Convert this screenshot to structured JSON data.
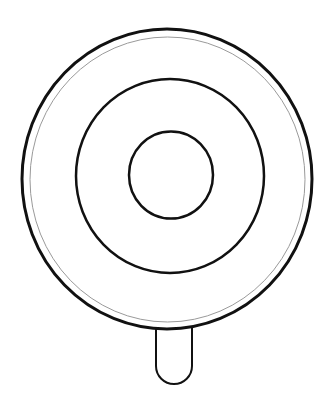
{
  "illustration": {
    "subject": "lollipop line drawing",
    "background": "#ffffff",
    "stroke_color": "#111111",
    "inner_rim_color": "#9a9a9a",
    "outer_ring": {
      "cx": 167,
      "cy": 179,
      "rx": 145,
      "ry": 150,
      "stroke_width": 3
    },
    "inner_rim": {
      "cx": 167.5,
      "cy": 179.5,
      "rx": 137.5,
      "ry": 142.5,
      "stroke_width": 1
    },
    "middle_ring": {
      "cx": 170,
      "cy": 176,
      "rx": 94,
      "ry": 97,
      "stroke_width": 2.5
    },
    "center_circle": {
      "cx": 171,
      "cy": 175,
      "rx": 42,
      "ry": 43.5,
      "stroke_width": 2.5
    },
    "stick": {
      "x_left": 156,
      "x_right": 192,
      "y_top": 330,
      "y_bottom": 384,
      "stroke_width": 2
    }
  }
}
